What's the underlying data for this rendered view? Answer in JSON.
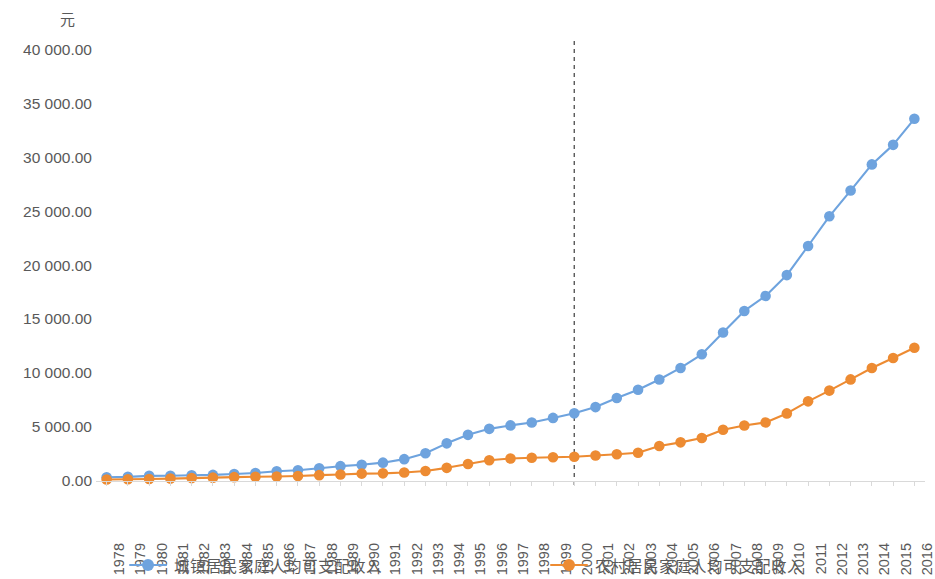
{
  "chart_data": {
    "type": "line",
    "title": "",
    "subtitle": "",
    "unit_label": "元",
    "xlabel": "",
    "ylabel": "",
    "ylim": [
      0,
      40000
    ],
    "y_ticks": [
      0,
      5000,
      10000,
      15000,
      20000,
      25000,
      30000,
      35000,
      40000
    ],
    "y_tick_labels": [
      "0.00",
      "5 000.00",
      "10 000.00",
      "15 000.00",
      "20 000.00",
      "25 000.00",
      "30 000.00",
      "35 000.00",
      "40 000.00"
    ],
    "grid": false,
    "legend_position": "bottom",
    "categories": [
      "1978",
      "1979",
      "1980",
      "1981",
      "1982",
      "1983",
      "1984",
      "1985",
      "1986",
      "1987",
      "1988",
      "1989",
      "1990",
      "1991",
      "1992",
      "1993",
      "1994",
      "1995",
      "1996",
      "1997",
      "1998",
      "1999",
      "2000",
      "2001",
      "2002",
      "2003",
      "2004",
      "2005",
      "2006",
      "2007",
      "2008",
      "2009",
      "2010",
      "2011",
      "2012",
      "2013",
      "2014",
      "2015",
      "2016"
    ],
    "series": [
      {
        "name": "城镇居民家庭人均可支配收入",
        "color": "#6EA3DE",
        "values": [
          343,
          387,
          478,
          492,
          527,
          564,
          652,
          739,
          900,
          1002,
          1181,
          1376,
          1510,
          1701,
          2027,
          2577,
          3496,
          4283,
          4839,
          5160,
          5425,
          5854,
          6280,
          6860,
          7703,
          8472,
          9422,
          10493,
          11760,
          13786,
          15781,
          17175,
          19109,
          21810,
          24565,
          26955,
          29381,
          31195,
          33616
        ]
      },
      {
        "name": "农村居民家庭人均可支配收入",
        "color": "#ED8B32",
        "values": [
          134,
          160,
          191,
          223,
          270,
          310,
          355,
          398,
          424,
          463,
          545,
          602,
          686,
          709,
          784,
          922,
          1221,
          1578,
          1926,
          2090,
          2162,
          2210,
          2253,
          2366,
          2476,
          2622,
          3255,
          3587,
          3987,
          4761,
          5153,
          5435,
          6272,
          7394,
          8389,
          9430,
          10489,
          11422,
          12363
        ]
      }
    ],
    "annotations": [
      {
        "type": "vertical-reference-line",
        "at_category": "2000",
        "style": "dashed",
        "color": "#595959"
      }
    ]
  },
  "legend": {
    "items": [
      {
        "label": "城镇居民家庭人均可支配收入",
        "color": "#6EA3DE"
      },
      {
        "label": "农村居民家庭人均可支配收入",
        "color": "#ED8B32"
      }
    ]
  }
}
